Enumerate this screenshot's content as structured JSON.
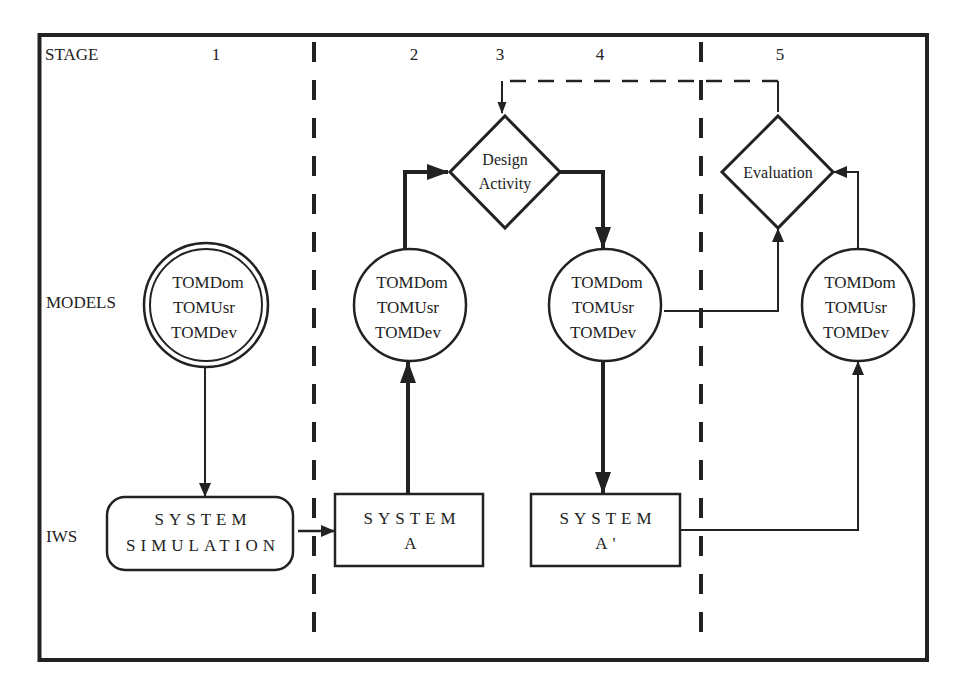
{
  "diagram": {
    "row_labels": {
      "stage": "STAGE",
      "models": "MODELS",
      "iws": "IWS"
    },
    "stages": [
      "1",
      "2",
      "3",
      "4",
      "5"
    ],
    "model_nodes": [
      {
        "line1": "TOMDom",
        "line2": "TOMUsr",
        "line3": "TOMDev",
        "style": "double-circle",
        "stage": "1"
      },
      {
        "line1": "TOMDom",
        "line2": "TOMUsr",
        "line3": "TOMDev",
        "style": "circle",
        "stage": "2"
      },
      {
        "line1": "TOMDom",
        "line2": "TOMUsr",
        "line3": "TOMDev",
        "style": "circle",
        "stage": "4"
      },
      {
        "line1": "TOMDom",
        "line2": "TOMUsr",
        "line3": "TOMDev",
        "style": "circle",
        "stage": "5"
      }
    ],
    "decisions": {
      "design": {
        "line1": "Design",
        "line2": "Activity"
      },
      "evaluation": {
        "line1": "Evaluation"
      }
    },
    "iws_nodes": {
      "simulation": {
        "line1": "SYSTEM",
        "line2": "SIMULATION"
      },
      "system_a": {
        "line1": "SYSTEM",
        "line2": "A"
      },
      "system_a_prime": {
        "line1": "SYSTEM",
        "line2": "A'"
      }
    },
    "colors": {
      "ink": "#222222",
      "background": "#ffffff"
    }
  }
}
